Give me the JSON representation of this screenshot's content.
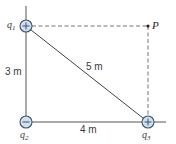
{
  "diagram": {
    "type": "point-charges-geometry",
    "colors": {
      "line": "#444444",
      "charge_fill": "#cfe0ee",
      "charge_stroke": "#3f5468",
      "text": "#3a3a3a"
    },
    "charges": [
      {
        "id": "q1",
        "symbol": "q",
        "subscript": "1",
        "sign": "+",
        "position": "top-left"
      },
      {
        "id": "q2",
        "symbol": "q",
        "subscript": "2",
        "sign": "−",
        "position": "bottom-left"
      },
      {
        "id": "q3",
        "symbol": "q",
        "subscript": "3",
        "sign": "+",
        "position": "bottom-right"
      }
    ],
    "point": {
      "label": "P",
      "position": "top-right"
    },
    "distances": {
      "vertical": "3 m",
      "horizontal": "4 m",
      "diagonal": "5 m"
    }
  }
}
